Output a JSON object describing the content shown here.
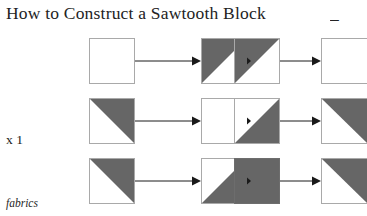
{
  "title": {
    "text": "How to Construct a Sawtooth Block",
    "tail": "_"
  },
  "labels": {
    "multiplier": "x 1",
    "fabrics": "fabrics"
  },
  "colors": {
    "fabric_gray": "#666666",
    "patch_outline": "#a9a9a9",
    "arrow": "#1a1a1a",
    "text": "#1b1b1b",
    "background": "#ffffff"
  },
  "diagram": {
    "type": "construction-sequence-grid",
    "rows": 3,
    "columns": 4,
    "patch_size": 46,
    "rows_data": [
      {
        "row_index": 1,
        "patches": [
          {
            "name": "patch-r1c1",
            "fill": "plain",
            "shade": "white",
            "clipped": false
          },
          {
            "name": "patch-r1c2",
            "fill": "half-square-triangle",
            "triangle": "upper-left",
            "shade": "gray",
            "clipped": false
          },
          {
            "name": "patch-r1c3",
            "fill": "half-square-triangle",
            "triangle": "upper-left",
            "shade": "gray",
            "clipped": false
          },
          {
            "name": "patch-r1c4",
            "fill": "plain",
            "shade": "white",
            "clipped": true
          }
        ]
      },
      {
        "row_index": 2,
        "patches": [
          {
            "name": "patch-r2c1",
            "fill": "half-square-triangle",
            "triangle": "upper-right",
            "shade": "gray",
            "clipped": false
          },
          {
            "name": "patch-r2c2",
            "fill": "plain",
            "shade": "white",
            "clipped": false
          },
          {
            "name": "patch-r2c3",
            "fill": "half-square-triangle",
            "triangle": "lower-right",
            "shade": "gray",
            "clipped": false
          },
          {
            "name": "patch-r2c4",
            "fill": "half-square-triangle",
            "triangle": "upper-right",
            "shade": "gray",
            "clipped": true
          }
        ]
      },
      {
        "row_index": 3,
        "patches": [
          {
            "name": "patch-r3c1",
            "fill": "half-square-triangle",
            "triangle": "upper-right",
            "shade": "gray",
            "clipped": false
          },
          {
            "name": "patch-r3c2",
            "fill": "half-square-triangle",
            "triangle": "lower-right",
            "shade": "gray",
            "clipped": false
          },
          {
            "name": "patch-r3c3",
            "fill": "solid",
            "shade": "gray",
            "clipped": false
          },
          {
            "name": "patch-r3c4",
            "fill": "half-square-triangle",
            "triangle": "upper-right",
            "shade": "gray",
            "clipped": true
          }
        ]
      }
    ],
    "arrows": [
      {
        "name": "arrow-r1c1-c2",
        "row": 1,
        "from_column": 1,
        "to_column": 2
      },
      {
        "name": "arrow-r1c2-c3",
        "row": 1,
        "from_column": 2,
        "to_column": 3
      },
      {
        "name": "arrow-r1c3-c4",
        "row": 1,
        "from_column": 3,
        "to_column": 4
      },
      {
        "name": "arrow-r2c1-c2",
        "row": 2,
        "from_column": 1,
        "to_column": 2
      },
      {
        "name": "arrow-r2c2-c3",
        "row": 2,
        "from_column": 2,
        "to_column": 3
      },
      {
        "name": "arrow-r2c3-c4",
        "row": 2,
        "from_column": 3,
        "to_column": 4
      },
      {
        "name": "arrow-r3c1-c2",
        "row": 3,
        "from_column": 1,
        "to_column": 2
      },
      {
        "name": "arrow-r3c2-c3",
        "row": 3,
        "from_column": 2,
        "to_column": 3
      },
      {
        "name": "arrow-r3c3-c4",
        "row": 3,
        "from_column": 3,
        "to_column": 4
      }
    ]
  },
  "geometry": {
    "column_x": [
      89,
      201,
      234,
      321
    ],
    "row_y": [
      38,
      98,
      158
    ]
  }
}
